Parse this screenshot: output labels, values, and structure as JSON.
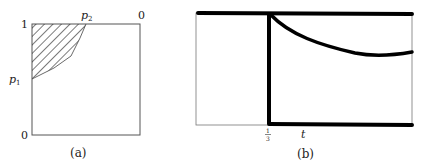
{
  "panel_a": {
    "caption": "(a)",
    "label_top_left": "1",
    "label_top_p": "p",
    "label_top_p_sub": "2",
    "label_top_right": "0",
    "label_left_p": "p",
    "label_left_p_sub": "1",
    "label_bottom_left": "0",
    "hatch_color": "#222222"
  },
  "panel_b": {
    "caption": "(b)",
    "tick_num": "1",
    "tick_den": "3",
    "axis_label": "t",
    "line_color": "#000000"
  }
}
